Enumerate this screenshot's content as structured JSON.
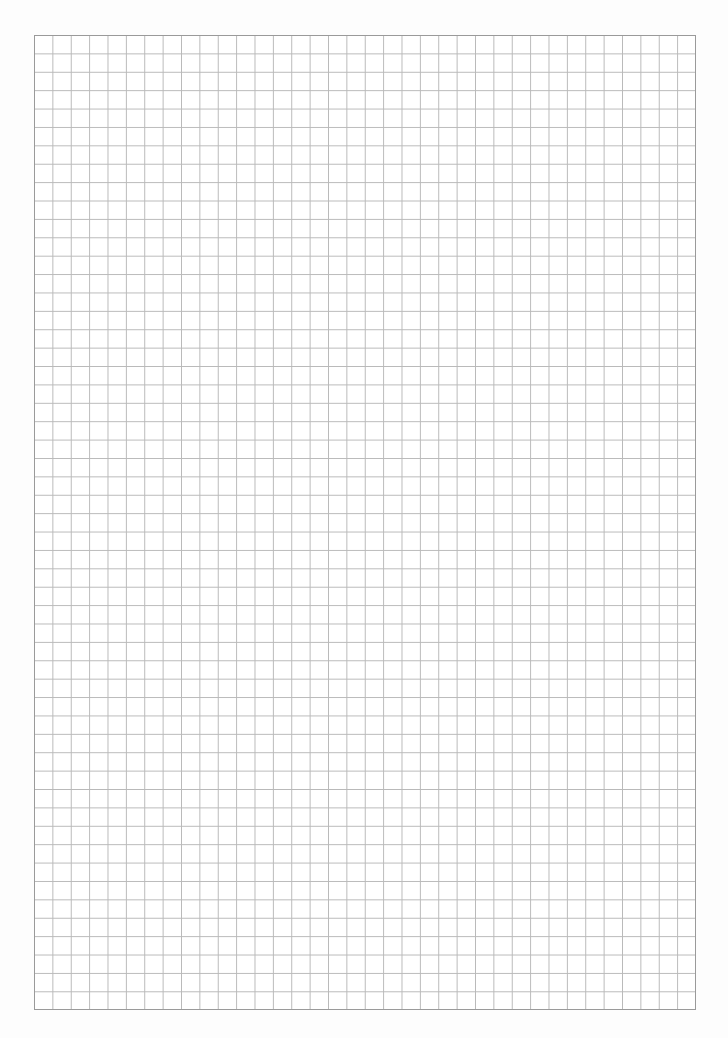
{
  "page": {
    "type": "grid-paper",
    "background_color": "#ffffff",
    "line_color": "#b9b9b9",
    "border_color": "#9a9a9a"
  },
  "grid": {
    "columns": 36,
    "rows": 53,
    "cell_size_px": 18.4,
    "left": 34,
    "top": 35,
    "width": 662,
    "height": 975
  }
}
